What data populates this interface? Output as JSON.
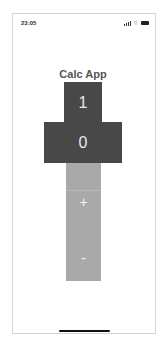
{
  "status_bar": {
    "time": "23:05",
    "icons": [
      "signal-icon",
      "wifi-icon",
      "battery-icon"
    ],
    "wifi_glyph": "⌔"
  },
  "app": {
    "title": "Calc App",
    "display_top": "1",
    "display_main": "0",
    "keys": [
      {
        "label": "+",
        "name": "plus"
      },
      {
        "label": "-",
        "name": "minus"
      }
    ]
  },
  "colors": {
    "display_bg": "#484848",
    "keypad_bg": "#a9a9a9",
    "title": "#555555"
  }
}
